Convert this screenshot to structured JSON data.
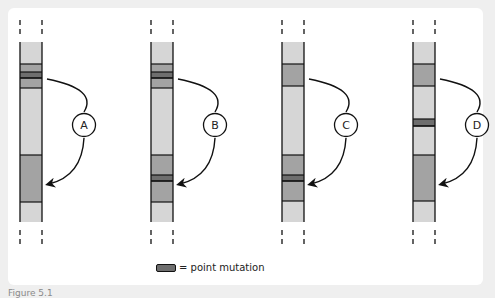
{
  "figure": {
    "type": "chromosome point-mutation diagram",
    "colors": {
      "background": "#efefef",
      "panel": "#ffffff",
      "light_band": "#d6d6d6",
      "mid_band": "#a3a3a3",
      "mutation_band": "#6e6e6e",
      "stroke": "#111111"
    },
    "panels": [
      {
        "label": "A",
        "bands": [
          {
            "y0": 42,
            "y1": 64,
            "kind": "light"
          },
          {
            "y0": 64,
            "y1": 72,
            "kind": "mid"
          },
          {
            "y0": 72,
            "y1": 78,
            "kind": "mutation"
          },
          {
            "y0": 78,
            "y1": 88,
            "kind": "mid"
          },
          {
            "y0": 88,
            "y1": 155,
            "kind": "light"
          },
          {
            "y0": 155,
            "y1": 202,
            "kind": "mid"
          },
          {
            "y0": 202,
            "y1": 222,
            "kind": "light"
          }
        ]
      },
      {
        "label": "B",
        "bands": [
          {
            "y0": 42,
            "y1": 64,
            "kind": "light"
          },
          {
            "y0": 64,
            "y1": 72,
            "kind": "mid"
          },
          {
            "y0": 72,
            "y1": 78,
            "kind": "mutation"
          },
          {
            "y0": 78,
            "y1": 88,
            "kind": "mid"
          },
          {
            "y0": 88,
            "y1": 155,
            "kind": "light"
          },
          {
            "y0": 155,
            "y1": 175,
            "kind": "mid"
          },
          {
            "y0": 175,
            "y1": 181,
            "kind": "mutation"
          },
          {
            "y0": 181,
            "y1": 202,
            "kind": "mid"
          },
          {
            "y0": 202,
            "y1": 222,
            "kind": "light"
          }
        ]
      },
      {
        "label": "C",
        "bands": [
          {
            "y0": 42,
            "y1": 64,
            "kind": "light"
          },
          {
            "y0": 64,
            "y1": 86,
            "kind": "mid"
          },
          {
            "y0": 86,
            "y1": 155,
            "kind": "light"
          },
          {
            "y0": 155,
            "y1": 175,
            "kind": "mid"
          },
          {
            "y0": 175,
            "y1": 181,
            "kind": "mutation"
          },
          {
            "y0": 181,
            "y1": 201,
            "kind": "mid"
          },
          {
            "y0": 201,
            "y1": 222,
            "kind": "light"
          }
        ]
      },
      {
        "label": "D",
        "bands": [
          {
            "y0": 42,
            "y1": 64,
            "kind": "light"
          },
          {
            "y0": 64,
            "y1": 86,
            "kind": "mid"
          },
          {
            "y0": 86,
            "y1": 119,
            "kind": "light"
          },
          {
            "y0": 119,
            "y1": 126,
            "kind": "mutation"
          },
          {
            "y0": 126,
            "y1": 155,
            "kind": "light"
          },
          {
            "y0": 155,
            "y1": 201,
            "kind": "mid"
          },
          {
            "y0": 201,
            "y1": 222,
            "kind": "light"
          }
        ]
      }
    ]
  },
  "legend": {
    "label": "= point mutation"
  },
  "caption": {
    "text": "Figure 5.1"
  }
}
